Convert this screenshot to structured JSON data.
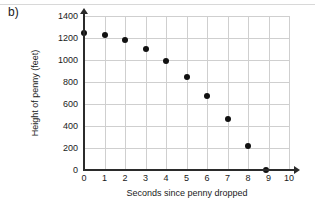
{
  "panel": {
    "label": "b)"
  },
  "chart_data": {
    "type": "scatter",
    "title": "",
    "xlabel": "Seconds since penny dropped",
    "ylabel": "Height of penny (feet)",
    "xlim": [
      0,
      10
    ],
    "ylim": [
      0,
      1400
    ],
    "xticks": [
      "0",
      "1",
      "2",
      "3",
      "4",
      "5",
      "6",
      "7",
      "8",
      "9",
      "10"
    ],
    "yticks": [
      "0",
      "200",
      "400",
      "600",
      "800",
      "1000",
      "1200",
      "1400"
    ],
    "grid": true,
    "legend": "none",
    "marker": "filled-circle",
    "marker_color": "#111111",
    "x": [
      0,
      1,
      2,
      3,
      4,
      5,
      6,
      7,
      8,
      8.9
    ],
    "y": [
      1250,
      1230,
      1185,
      1100,
      995,
      850,
      670,
      460,
      215,
      0
    ],
    "points": [
      {
        "x": 0,
        "y": 1250
      },
      {
        "x": 1,
        "y": 1230
      },
      {
        "x": 2,
        "y": 1185
      },
      {
        "x": 3,
        "y": 1100
      },
      {
        "x": 4,
        "y": 995
      },
      {
        "x": 5,
        "y": 850
      },
      {
        "x": 6,
        "y": 670
      },
      {
        "x": 7,
        "y": 460
      },
      {
        "x": 8,
        "y": 215
      },
      {
        "x": 8.9,
        "y": 0
      }
    ]
  }
}
